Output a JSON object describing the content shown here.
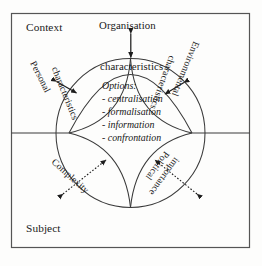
{
  "diagram": {
    "corner_labels": {
      "top_left": "Context",
      "bottom_left": "Subject"
    },
    "nodes": {
      "top": "Organisation",
      "top_inner": "characteristics",
      "left": "Personal",
      "left_inner": "characteristics",
      "right": "Environmental",
      "right_inner": "characteristics",
      "bottom_left_petal": "Complexity",
      "bottom_right_petal_line1": "Political",
      "bottom_right_petal_line2": "importance"
    },
    "options": {
      "heading": "Options:",
      "items": [
        "- centralisation",
        "- formalisation",
        "- information",
        "- confrontation"
      ]
    },
    "colors": {
      "line": "#3a3a3a",
      "frame": "#555555",
      "arrow": "#1d1d1d",
      "text": "#1a1a1a",
      "background": "#fdfdfc"
    }
  }
}
